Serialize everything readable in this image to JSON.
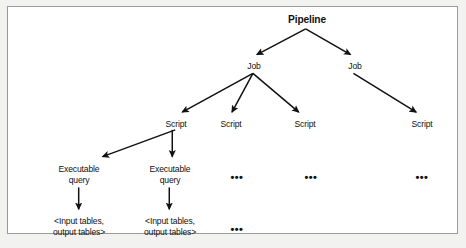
{
  "figure": {
    "background": "#ffffff",
    "border_color": "#9a9a9a",
    "ink_color": "#111111"
  },
  "nodes": {
    "pipeline": {
      "label": "Pipeline",
      "x": 299,
      "y": 8
    },
    "job_1": {
      "label": "Job",
      "x": 246,
      "y": 54
    },
    "job_2": {
      "label": "Job",
      "x": 347,
      "y": 54
    },
    "script_1": {
      "label": "Script",
      "x": 168,
      "y": 112
    },
    "script_2": {
      "label": "Script",
      "x": 223,
      "y": 112
    },
    "script_3": {
      "label": "Script",
      "x": 297,
      "y": 112
    },
    "script_4": {
      "label": "Script",
      "x": 414,
      "y": 112
    },
    "exec_query_1": {
      "label": "Executable\nquery",
      "x": 71,
      "y": 157
    },
    "exec_query_2": {
      "label": "Executable\nquery",
      "x": 162,
      "y": 157
    },
    "exec_dots_1": {
      "label": "•••",
      "x": 229,
      "y": 166
    },
    "exec_dots_2": {
      "label": "•••",
      "x": 303,
      "y": 166
    },
    "exec_dots_3": {
      "label": "•••",
      "x": 414,
      "y": 166
    },
    "tables_1": {
      "label": "<Input tables,\noutput tables>",
      "x": 71,
      "y": 209
    },
    "tables_2": {
      "label": "<Input tables,\noutput tables>",
      "x": 162,
      "y": 209
    },
    "tables_dots_1": {
      "label": "•••",
      "x": 229,
      "y": 218
    }
  },
  "edges": [
    {
      "name": "pipeline-to-job-1",
      "x1": 299,
      "y1": 22,
      "x2": 250,
      "y2": 48
    },
    {
      "name": "pipeline-to-job-2",
      "x1": 299,
      "y1": 22,
      "x2": 344,
      "y2": 48
    },
    {
      "name": "job-1-to-script-1",
      "x1": 246,
      "y1": 67,
      "x2": 175,
      "y2": 106
    },
    {
      "name": "job-1-to-script-2",
      "x1": 246,
      "y1": 67,
      "x2": 225,
      "y2": 106
    },
    {
      "name": "job-1-to-script-3",
      "x1": 246,
      "y1": 67,
      "x2": 292,
      "y2": 106
    },
    {
      "name": "job-2-to-script-4",
      "x1": 347,
      "y1": 67,
      "x2": 410,
      "y2": 106
    },
    {
      "name": "script-1-to-exec-query-1",
      "x1": 168,
      "y1": 124,
      "x2": 95,
      "y2": 151
    },
    {
      "name": "script-1-to-exec-query-2",
      "x1": 165,
      "y1": 124,
      "x2": 165,
      "y2": 151
    },
    {
      "name": "exec-query-1-to-tables-1",
      "x1": 71,
      "y1": 182,
      "x2": 71,
      "y2": 204
    },
    {
      "name": "exec-query-2-to-tables-2",
      "x1": 162,
      "y1": 182,
      "x2": 162,
      "y2": 204
    }
  ]
}
